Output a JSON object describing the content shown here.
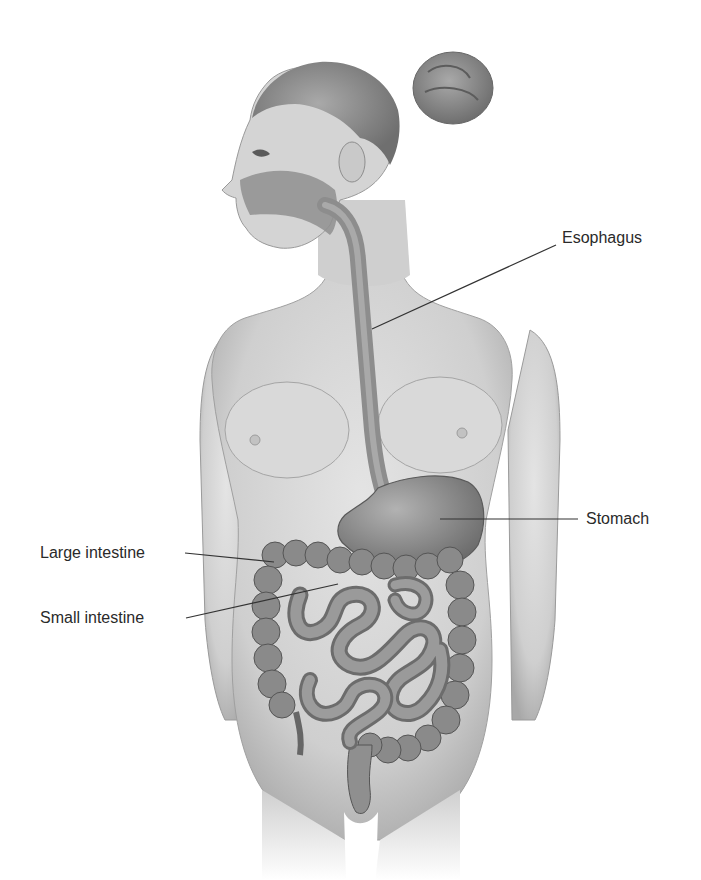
{
  "diagram": {
    "labels": [
      {
        "id": "esophagus",
        "text": "Esophagus",
        "x": 562,
        "y": 206,
        "line": [
          [
            556,
            245
          ],
          [
            372,
            329
          ]
        ]
      },
      {
        "id": "stomach",
        "text": "Stomach",
        "x": 588,
        "y": 512,
        "line": [
          [
            578,
            519
          ],
          [
            440,
            519
          ]
        ]
      },
      {
        "id": "large-intestine",
        "text": "Large intestine",
        "x": 40,
        "y": 546,
        "line": [
          [
            185,
            553
          ],
          [
            274,
            562
          ]
        ]
      },
      {
        "id": "small-intestine",
        "text": "Small intestine",
        "x": 40,
        "y": 612,
        "line": [
          [
            186,
            618
          ],
          [
            338,
            584
          ]
        ]
      }
    ]
  },
  "colors": {
    "background": "#ffffff",
    "skin": "#d6d6d6",
    "skin_shadow": "#9a9a9a",
    "hair": "#8a8a8a",
    "organ": "#8c8c8c",
    "organ_dark": "#5e5e5e",
    "leader_line": "#333333",
    "label_text": "#2a2a2a"
  }
}
